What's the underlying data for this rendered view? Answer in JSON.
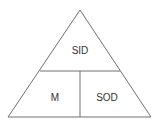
{
  "diagram": {
    "type": "triangle-pyramid",
    "sections": {
      "top": "SID",
      "bottom_left": "M",
      "bottom_right": "SOD"
    },
    "colors": {
      "stroke": "#707070",
      "text": "#333333",
      "background": "#ffffff"
    }
  }
}
